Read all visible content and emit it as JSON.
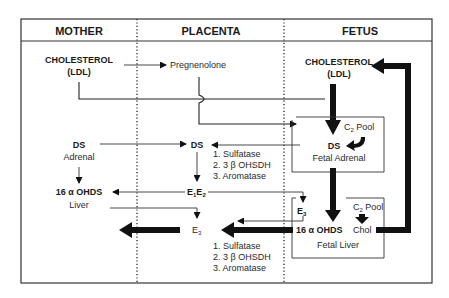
{
  "header": {
    "columns": [
      {
        "label": "MOTHER"
      },
      {
        "label": "PLACENTA"
      },
      {
        "label": "FETUS"
      }
    ]
  },
  "mother": {
    "cholesterol": "CHOLESTEROL",
    "cholesterol_sub": "(LDL)",
    "ds": "DS",
    "adrenal": "Adrenal",
    "ohds": "16 α OHDS",
    "liver": "Liver"
  },
  "placenta": {
    "pregnenolone": "Pregnenolone",
    "ds": "DS",
    "enzymes_top": [
      "1. Sulfatase",
      "2. 3 β OHSDH",
      "3. Aromatase"
    ],
    "e1e2": {
      "e": "E",
      "one": "1",
      "e2": "E",
      "two": "2"
    },
    "e3": {
      "e": "E",
      "three": "3"
    },
    "enzymes_bottom": [
      "1. Sulfatase",
      "2. 3 β OHSDH",
      "3. Aromatase"
    ]
  },
  "fetus": {
    "cholesterol": "CHOLESTEROL",
    "cholesterol_sub": "(LDL)",
    "adrenal_box": {
      "pool": {
        "c": "C",
        "sub": "2",
        "rest": " Pool"
      },
      "ds": "DS",
      "label": "Fetal Adrenal"
    },
    "liver_box": {
      "e3": {
        "e": "E",
        "three": "3"
      },
      "pool": {
        "c": "C",
        "sub": "2",
        "rest": " Pool"
      },
      "ohds": "16 α OHDS",
      "chol": "Chol",
      "label": "Fetal Liver"
    }
  }
}
